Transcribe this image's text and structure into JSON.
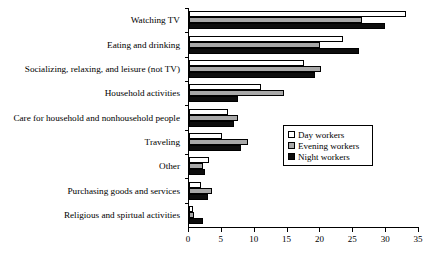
{
  "chart_data": {
    "type": "bar",
    "orientation": "horizontal",
    "title": "",
    "xlabel": "",
    "ylabel": "",
    "xlim": [
      0,
      35
    ],
    "xticks": [
      0,
      5,
      10,
      15,
      20,
      25,
      30,
      35
    ],
    "xtick_labels": [
      "0",
      "5",
      "10",
      "15",
      "20",
      "25",
      "30",
      "35"
    ],
    "grid": false,
    "legend_position": "center-right",
    "categories": [
      "Watching TV",
      "Eating and drinking",
      "Socializing, relaxing, and leisure (not TV)",
      "Household activities",
      "Care for household and nonhousehold people",
      "Traveling",
      "Other",
      "Purchasing goods and services",
      "Religious and spirtual activities"
    ],
    "series": [
      {
        "name": "Day workers",
        "color": "#ffffff",
        "values": [
          33.0,
          23.5,
          17.5,
          11.0,
          5.9,
          5.0,
          3.0,
          1.9,
          0.6
        ]
      },
      {
        "name": "Evening workers",
        "color": "#a8a8a8",
        "values": [
          26.3,
          20.0,
          20.1,
          14.5,
          7.4,
          9.0,
          2.2,
          3.5,
          0.8
        ]
      },
      {
        "name": "Night workers",
        "color": "#0d0d0d",
        "values": [
          29.8,
          25.9,
          19.1,
          7.5,
          6.8,
          7.9,
          2.5,
          2.9,
          2.2
        ]
      }
    ]
  },
  "legend": {
    "entries": [
      {
        "label": "Day workers",
        "swatch": "white-square-icon"
      },
      {
        "label": "Evening workers",
        "swatch": "gray-square-icon"
      },
      {
        "label": "Night workers",
        "swatch": "black-square-icon"
      }
    ]
  }
}
